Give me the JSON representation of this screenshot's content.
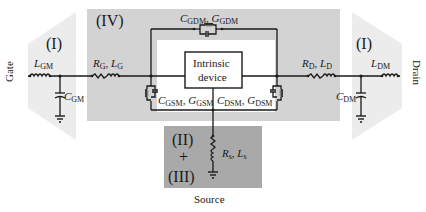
{
  "diagram": {
    "type": "equivalent-circuit",
    "regions": {
      "region_I_left": "(I)",
      "region_I_right": "(I)",
      "region_IV": "(IV)",
      "region_II": "(II)",
      "region_plus": "+",
      "region_III": "(III)"
    },
    "terminals": {
      "gate": "Gate",
      "drain": "Drain",
      "source": "Source"
    },
    "intrinsic_device": {
      "line1": "Intrinsic",
      "line2": "device"
    },
    "components": {
      "L_GM": {
        "sym": "L",
        "sub": "GM"
      },
      "C_GM": {
        "sym": "C",
        "sub": "GM"
      },
      "R_G": {
        "sym": "R",
        "sub": "G"
      },
      "L_G": {
        "sym": "L",
        "sub": "G"
      },
      "C_GDM": {
        "sym": "C",
        "sub": "GDM"
      },
      "G_GDM": {
        "sym": "G",
        "sub": "GDM"
      },
      "C_GSM": {
        "sym": "C",
        "sub": "GSM"
      },
      "G_GSM": {
        "sym": "G",
        "sub": "GSM"
      },
      "C_DSM": {
        "sym": "C",
        "sub": "DSM"
      },
      "G_DSM": {
        "sym": "G",
        "sub": "DSM"
      },
      "R_D": {
        "sym": "R",
        "sub": "D"
      },
      "L_D": {
        "sym": "L",
        "sub": "D"
      },
      "L_DM": {
        "sym": "L",
        "sub": "DM"
      },
      "C_DM": {
        "sym": "C",
        "sub": "DM"
      },
      "R_s": {
        "sym": "R",
        "sub": "s"
      },
      "L_s": {
        "sym": "L",
        "sub": "s"
      }
    },
    "separator": ", ",
    "colors": {
      "region_IV_fill": "#d3d3d3",
      "region_I_fill": "#ececec",
      "region_II_III_fill": "#a9a9a9",
      "inner_white": "#ffffff",
      "wire": "#1a1a1a"
    }
  }
}
